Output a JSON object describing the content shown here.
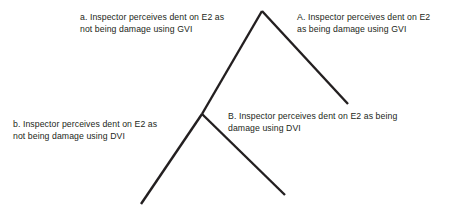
{
  "diagram": {
    "type": "decision-tree",
    "background_color": "#ffffff",
    "line_color": "#231f20",
    "text_color": "#231f20",
    "nodes": [
      {
        "id": "a",
        "label": "a. Inspector perceives dent on E2 as\nnot being damage using GVI",
        "position": "top-left"
      },
      {
        "id": "A",
        "label": "A.  Inspector perceives dent on E2\nas being damage using GVI",
        "position": "top-right"
      },
      {
        "id": "b",
        "label": "b. Inspector perceives dent on E2 as\nnot being damage using DVI",
        "position": "bottom-left"
      },
      {
        "id": "B",
        "label": "B. Inspector perceives dent on E2 as being\ndamage using DVI",
        "position": "bottom-right"
      }
    ],
    "branches": [
      {
        "id": "root-to-a",
        "from": [
          262,
          11
        ],
        "to": [
          202,
          114
        ]
      },
      {
        "id": "root-to-A",
        "from": [
          262,
          11
        ],
        "to": [
          348,
          104
        ]
      },
      {
        "id": "node-to-b",
        "from": [
          202,
          114
        ],
        "to": [
          141,
          204
        ]
      },
      {
        "id": "node-to-B",
        "from": [
          202,
          114
        ],
        "to": [
          285,
          195
        ]
      }
    ]
  }
}
